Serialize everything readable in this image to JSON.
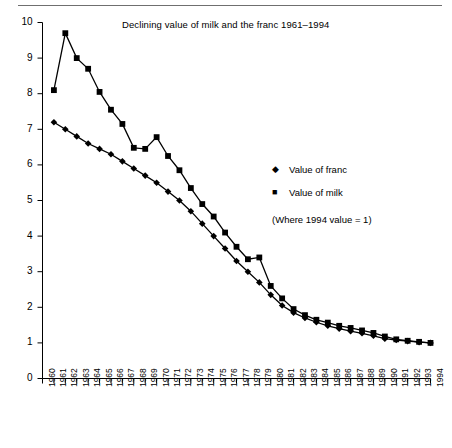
{
  "figure": {
    "title": "Declining value of milk and the franc 1961–1994",
    "has_top_rule": true
  },
  "legend": {
    "position": "inside-right",
    "entries": [
      {
        "marker": "◆",
        "label": "Value of franc"
      },
      {
        "marker": "■",
        "label": "Value of milk"
      }
    ],
    "note": "(Where 1994 value = 1)"
  },
  "axes": {
    "y_ticks": [
      "0",
      "1",
      "2",
      "3",
      "4",
      "5",
      "6",
      "7",
      "8",
      "9",
      "10"
    ],
    "x_ticks": [
      "1960",
      "1961",
      "1962",
      "1963",
      "1964",
      "1965",
      "1966",
      "1967",
      "1968",
      "1969",
      "1970",
      "1971",
      "1972",
      "1973",
      "1974",
      "1975",
      "1976",
      "1977",
      "1978",
      "1979",
      "1980",
      "1981",
      "1982",
      "1983",
      "1984",
      "1985",
      "1986",
      "1987",
      "1988",
      "1989",
      "1990",
      "1991",
      "1992",
      "1993",
      "1994"
    ]
  },
  "chart_data": {
    "type": "line",
    "title": "Declining value of milk and the franc 1961–1994",
    "xlabel": "",
    "ylabel": "",
    "xlim": [
      1960,
      1994
    ],
    "ylim": [
      0,
      10
    ],
    "grid": false,
    "legend_position": "inside-right",
    "annotations": [
      "(Where 1994 value = 1)"
    ],
    "x": [
      1960,
      1961,
      1962,
      1963,
      1964,
      1965,
      1966,
      1967,
      1968,
      1969,
      1970,
      1971,
      1972,
      1973,
      1974,
      1975,
      1976,
      1977,
      1978,
      1979,
      1980,
      1981,
      1982,
      1983,
      1984,
      1985,
      1986,
      1987,
      1988,
      1989,
      1990,
      1991,
      1992,
      1993,
      1994
    ],
    "series": [
      {
        "name": "Value of franc",
        "marker": "diamond",
        "values": [
          null,
          7.2,
          7.0,
          6.8,
          6.6,
          6.45,
          6.3,
          6.1,
          5.9,
          5.7,
          5.5,
          5.25,
          5.0,
          4.7,
          4.35,
          4.0,
          3.65,
          3.3,
          3.0,
          2.7,
          2.35,
          2.05,
          1.85,
          1.7,
          1.58,
          1.48,
          1.4,
          1.33,
          1.27,
          1.2,
          1.12,
          1.08,
          1.05,
          1.02,
          1.0
        ]
      },
      {
        "name": "Value of milk",
        "marker": "square",
        "values": [
          null,
          8.1,
          9.7,
          9.0,
          8.7,
          8.05,
          7.55,
          7.15,
          6.48,
          6.45,
          6.78,
          6.25,
          5.85,
          5.35,
          4.9,
          4.55,
          4.1,
          3.7,
          3.35,
          3.4,
          2.6,
          2.25,
          1.95,
          1.78,
          1.65,
          1.57,
          1.48,
          1.42,
          1.35,
          1.28,
          1.18,
          1.1,
          1.06,
          1.03,
          1.0
        ]
      }
    ]
  }
}
